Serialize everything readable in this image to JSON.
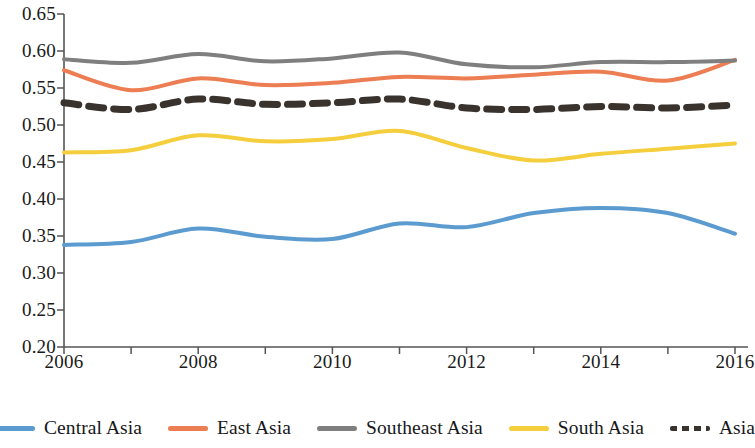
{
  "chart_data": {
    "type": "line",
    "title": "",
    "subtitle": "",
    "xlabel": "",
    "ylabel": "",
    "xlim": [
      2006,
      2016
    ],
    "ylim": [
      0.2,
      0.65
    ],
    "grid": false,
    "legend_position": "bottom",
    "x": [
      2006,
      2007,
      2008,
      2009,
      2010,
      2011,
      2012,
      2013,
      2014,
      2015,
      2016
    ],
    "xticks": [
      2006,
      2008,
      2010,
      2012,
      2014,
      2016
    ],
    "xtick_labels": [
      "2006",
      "2008",
      "2010",
      "2012",
      "2014",
      "2016"
    ],
    "xminor_ticks": [
      2006,
      2007,
      2008,
      2009,
      2010,
      2011,
      2012,
      2013,
      2014,
      2015,
      2016
    ],
    "yticks": [
      0.2,
      0.25,
      0.3,
      0.35,
      0.4,
      0.45,
      0.5,
      0.55,
      0.6,
      0.65
    ],
    "ytick_labels": [
      "0.20",
      "0.25",
      "0.30",
      "0.35",
      "0.40",
      "0.45",
      "0.50",
      "0.55",
      "0.60",
      "0.65"
    ],
    "series": [
      {
        "name": "Central Asia",
        "color": "#5b9bd0",
        "style": "solid",
        "values": [
          0.338,
          0.342,
          0.36,
          0.349,
          0.346,
          0.367,
          0.362,
          0.381,
          0.388,
          0.381,
          0.353
        ]
      },
      {
        "name": "East Asia",
        "color": "#ed7d52",
        "style": "solid",
        "values": [
          0.574,
          0.547,
          0.563,
          0.554,
          0.557,
          0.565,
          0.563,
          0.568,
          0.572,
          0.56,
          0.588
        ]
      },
      {
        "name": "Southeast Asia",
        "color": "#7f7f7f",
        "style": "solid",
        "values": [
          0.589,
          0.584,
          0.596,
          0.586,
          0.59,
          0.598,
          0.582,
          0.578,
          0.585,
          0.585,
          0.587
        ]
      },
      {
        "name": "South Asia",
        "color": "#f5ce3e",
        "style": "solid",
        "values": [
          0.463,
          0.466,
          0.486,
          0.478,
          0.481,
          0.492,
          0.469,
          0.452,
          0.461,
          0.468,
          0.475
        ]
      },
      {
        "name": "Asia",
        "color": "#3a332d",
        "style": "dashed",
        "values": [
          0.53,
          0.521,
          0.535,
          0.528,
          0.53,
          0.535,
          0.523,
          0.521,
          0.525,
          0.523,
          0.527
        ]
      }
    ]
  },
  "legend": {
    "items": [
      {
        "label": "Central Asia"
      },
      {
        "label": "East Asia"
      },
      {
        "label": "Southeast Asia"
      },
      {
        "label": "South Asia"
      },
      {
        "label": "Asia"
      }
    ]
  },
  "axes": {
    "axis_color": "#555555"
  }
}
